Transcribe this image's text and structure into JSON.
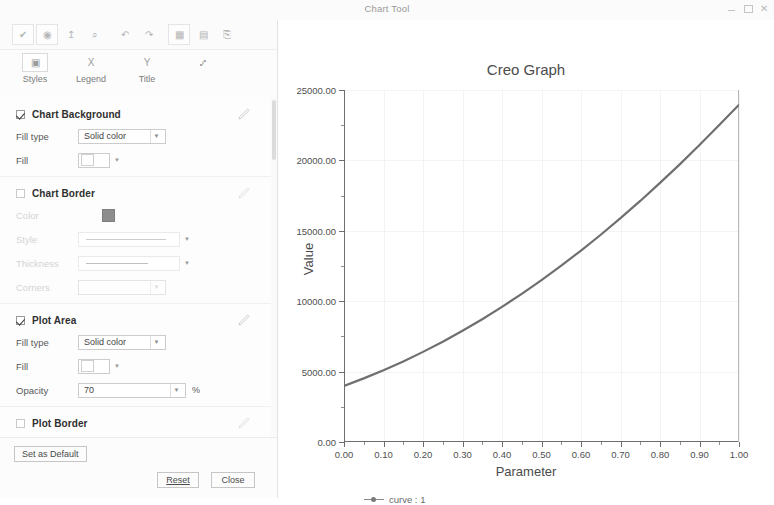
{
  "window": {
    "title": "Chart Tool",
    "controls": [
      {
        "name": "minimize",
        "glyph": "–"
      },
      {
        "name": "maximize",
        "glyph": "□"
      },
      {
        "name": "close",
        "glyph": "✕"
      }
    ]
  },
  "toolbar": {
    "buttons": [
      {
        "name": "apply-check-icon",
        "glyph": "✔"
      },
      {
        "name": "grid-target-icon",
        "glyph": "◉"
      },
      {
        "name": "axis-scale-icon",
        "glyph": "↥"
      },
      {
        "name": "zoom-icon",
        "glyph": "⌕"
      },
      {
        "name": "undo-icon",
        "glyph": "↶"
      },
      {
        "name": "redo-icon",
        "glyph": "↷"
      },
      {
        "name": "table-view-icon",
        "glyph": "▦"
      },
      {
        "name": "data-table-icon",
        "glyph": "▤"
      },
      {
        "name": "export-icon",
        "glyph": "⎘"
      }
    ]
  },
  "tabs": [
    {
      "label": "Styles",
      "icon": "styles-icon",
      "glyph": "▣",
      "selected": true
    },
    {
      "label": "Legend",
      "icon": "legend-x-icon",
      "glyph": "X",
      "selected": false
    },
    {
      "label": "Title",
      "icon": "title-y-icon",
      "glyph": "Y",
      "selected": false
    },
    {
      "label": "",
      "icon": "format-icon",
      "glyph": "⑇",
      "selected": false
    }
  ],
  "panel": {
    "groups": [
      {
        "name": "chart-background",
        "title": "Chart Background",
        "checked": true,
        "enabled": true,
        "rows": [
          {
            "label": "Fill type",
            "control": "combo",
            "value": "Solid color",
            "enabled": true
          },
          {
            "label": "Fill",
            "control": "swatch",
            "value": "",
            "enabled": true
          }
        ]
      },
      {
        "name": "chart-border",
        "title": "Chart Border",
        "checked": false,
        "enabled": false,
        "rows": [
          {
            "label": "Color",
            "control": "darkswatch",
            "value": "",
            "enabled": false
          },
          {
            "label": "Style",
            "control": "lineprev",
            "value": "",
            "enabled": false
          },
          {
            "label": "Thickness",
            "control": "lineprev-short",
            "value": "",
            "enabled": false
          },
          {
            "label": "Corners",
            "control": "combo",
            "value": "",
            "enabled": false
          }
        ]
      },
      {
        "name": "plot-area",
        "title": "Plot Area",
        "checked": true,
        "enabled": true,
        "rows": [
          {
            "label": "Fill type",
            "control": "combo",
            "value": "Solid color",
            "enabled": true
          },
          {
            "label": "Fill",
            "control": "swatch",
            "value": "",
            "enabled": true
          },
          {
            "label": "Opacity",
            "control": "combo-unit",
            "value": "70",
            "unit": "%",
            "enabled": true
          }
        ]
      },
      {
        "name": "plot-border",
        "title": "Plot Border",
        "checked": false,
        "enabled": false,
        "rows": []
      }
    ]
  },
  "footer": {
    "set_as_default": "Set as Default",
    "reset": "Reset",
    "close": "Close"
  },
  "chart_data": {
    "type": "line",
    "title": "Creo Graph",
    "xlabel": "Parameter",
    "ylabel": "Value",
    "xlim": [
      0.0,
      1.0
    ],
    "ylim": [
      0.0,
      25000.0
    ],
    "xticks": [
      "0.00",
      "0.10",
      "0.20",
      "0.30",
      "0.40",
      "0.50",
      "0.60",
      "0.70",
      "0.80",
      "0.90",
      "1.00"
    ],
    "xtick_values": [
      0.0,
      0.1,
      0.2,
      0.3,
      0.4,
      0.5,
      0.6,
      0.7,
      0.8,
      0.9,
      1.0
    ],
    "yticks": [
      "0.00",
      "5000.00",
      "10000.00",
      "15000.00",
      "20000.00",
      "25000.00"
    ],
    "ytick_values": [
      0,
      5000,
      10000,
      15000,
      20000,
      25000
    ],
    "grid": true,
    "legend_position": "bottom-left",
    "series": [
      {
        "name": "curve : 1",
        "marker": "dot",
        "color": "#6f6f6f",
        "x": [
          0.0,
          0.05,
          0.1,
          0.15,
          0.2,
          0.25,
          0.3,
          0.35,
          0.4,
          0.45,
          0.5,
          0.55,
          0.6,
          0.65,
          0.7,
          0.75,
          0.8,
          0.85,
          0.9,
          0.95,
          1.0
        ],
        "values": [
          3980,
          4520,
          5100,
          5720,
          6400,
          7120,
          7900,
          8720,
          9600,
          10520,
          11500,
          12520,
          13600,
          14720,
          15900,
          17120,
          18400,
          19720,
          21100,
          22520,
          23950
        ]
      }
    ]
  }
}
